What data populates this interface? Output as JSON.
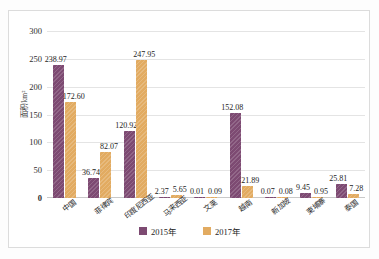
{
  "chart_data": {
    "type": "bar",
    "title": "",
    "xlabel": "",
    "ylabel": "面积/km²",
    "ylim": [
      0,
      300
    ],
    "yticks": [
      0,
      50,
      100,
      150,
      200,
      250,
      300
    ],
    "grid": true,
    "legend_position": "bottom",
    "categories": [
      "中国",
      "菲律宾",
      "印度尼西亚",
      "马来西亚",
      "文莱",
      "越南",
      "新加坡",
      "柬埔寨",
      "泰国"
    ],
    "series": [
      {
        "name": "2015年",
        "color": "#7d4a72",
        "values": [
          238.97,
          36.74,
          120.92,
          2.37,
          0.01,
          152.08,
          0.07,
          9.45,
          25.81
        ],
        "labels": [
          "238.97",
          "36.74",
          "120.92",
          "2.37",
          "0.01",
          "152.08",
          "0.07",
          "9.45",
          "25.81"
        ]
      },
      {
        "name": "2017年",
        "color": "#e2ab61",
        "values": [
          172.6,
          82.07,
          247.95,
          5.65,
          0.09,
          21.89,
          0.08,
          0.95,
          7.28
        ],
        "labels": [
          "172.60",
          "82.07",
          "247.95",
          "5.65",
          "0.09",
          "21.89",
          "0.08",
          "0.95",
          "7.28"
        ]
      }
    ]
  },
  "legend": {
    "items": [
      {
        "label": "2015年",
        "color": "#7d4a72"
      },
      {
        "label": "2017年",
        "color": "#e2ab61"
      }
    ]
  }
}
